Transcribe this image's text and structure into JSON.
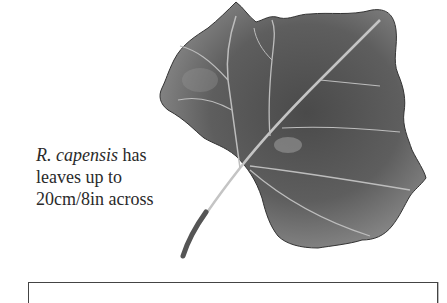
{
  "caption": {
    "species": "R. capensis",
    "line1_rest": " has",
    "line2": "leaves up to",
    "line3": "20cm/8in across"
  },
  "illustration": {
    "subject": "leaf-illustration",
    "fill_color": "#5a5a5a",
    "vein_color": "#c8c8c8"
  }
}
